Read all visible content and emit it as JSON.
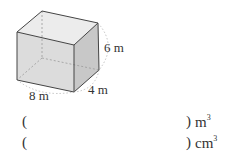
{
  "figure": {
    "shape": "rectangular-prism",
    "dimensions": {
      "length": "8 m",
      "width": "4 m",
      "height": "6 m"
    }
  },
  "answers": [
    {
      "open": "(",
      "close": ")",
      "unit": "m",
      "exponent": "3",
      "value": ""
    },
    {
      "open": "(",
      "close": ")",
      "unit": "cm",
      "exponent": "3",
      "value": ""
    }
  ]
}
